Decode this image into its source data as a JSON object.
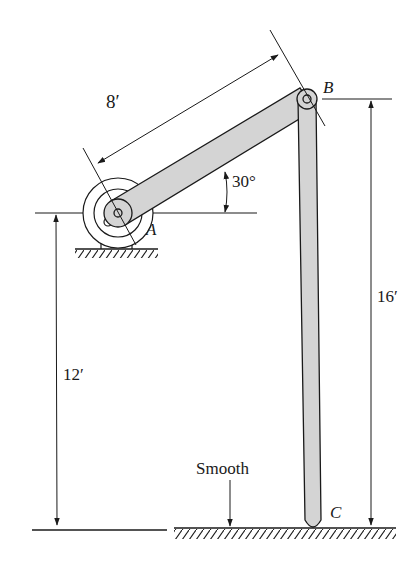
{
  "figure": {
    "type": "statics/dynamics mechanism diagram",
    "points": {
      "A": "A",
      "B": "B",
      "C": "C"
    },
    "dimensions": {
      "ab_length": "8′",
      "angle": "30°",
      "a_height": "12′",
      "b_height": "16′"
    },
    "annotations": {
      "surface": "Smooth"
    },
    "colors": {
      "ink": "#1a1a1a",
      "member_fill": "#d4d4d4",
      "background": "#ffffff"
    }
  }
}
